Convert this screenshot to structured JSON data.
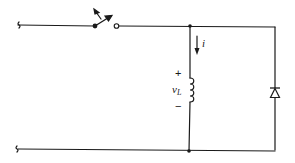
{
  "diagram": {
    "type": "circuit-schematic",
    "components": [
      {
        "id": "switch",
        "kind": "switch",
        "state": "open"
      },
      {
        "id": "inductor",
        "kind": "inductor"
      },
      {
        "id": "diode",
        "kind": "diode",
        "orientation": "cathode-up"
      }
    ],
    "labels": {
      "current": "i",
      "voltage_main": "v",
      "voltage_sub": "L",
      "plus": "+",
      "minus": "−"
    },
    "colors": {
      "line": "#1a1a1a",
      "background": "#ffffff"
    }
  }
}
